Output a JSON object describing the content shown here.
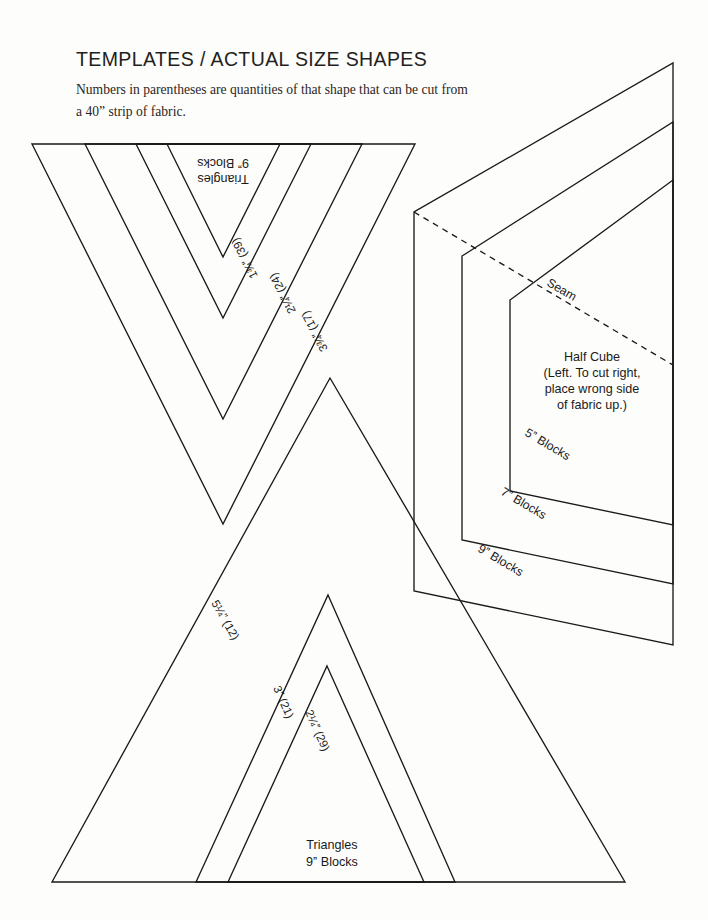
{
  "page": {
    "background_color": "#fdfdfb",
    "ink_color": "#1a1a1a"
  },
  "header": {
    "title": "Templates / Actual Size Shapes",
    "subtitle_line1": "Numbers in parentheses are quantities of that shape that can be cut",
    "subtitle_line2": "from a 40ˮ strip of fabric."
  },
  "shapes": {
    "top_triangle": {
      "name": "inverted-nested-triangles",
      "caption_line1": "Triangles",
      "caption_line2": "9ˮ Blocks",
      "orientation": "upside-down",
      "edge_labels": [
        {
          "text": "1¾ˮ (39)",
          "size": "1¾ˮ",
          "quantity": 39
        },
        {
          "text": "2¼ˮ (24)",
          "size": "2¼ˮ",
          "quantity": 24
        },
        {
          "text": "3¾ˮ (17)",
          "size": "3¾ˮ",
          "quantity": 17
        }
      ]
    },
    "bottom_triangle": {
      "name": "upright-nested-triangles",
      "caption_line1": "Triangles",
      "caption_line2": "9ˮ Blocks",
      "orientation": "upright",
      "edge_labels": [
        {
          "text": "5¼ˮ (12)",
          "size": "5¼ˮ",
          "quantity": 12
        },
        {
          "text": "3ˮ (21)",
          "size": "3ˮ",
          "quantity": 21
        },
        {
          "text": "2¼ˮ (29)",
          "size": "2¼ˮ",
          "quantity": 29
        }
      ]
    },
    "half_cube": {
      "name": "half-cube-template",
      "title": "Half Cube",
      "note_line1": "(Left. To cut right,",
      "note_line2": "place wrong side",
      "note_line3": "of fabric up.)",
      "seam_label": "Seam",
      "block_labels": [
        "5ˮ Blocks",
        "7ˮ Blocks",
        "9ˮ Blocks"
      ]
    }
  }
}
